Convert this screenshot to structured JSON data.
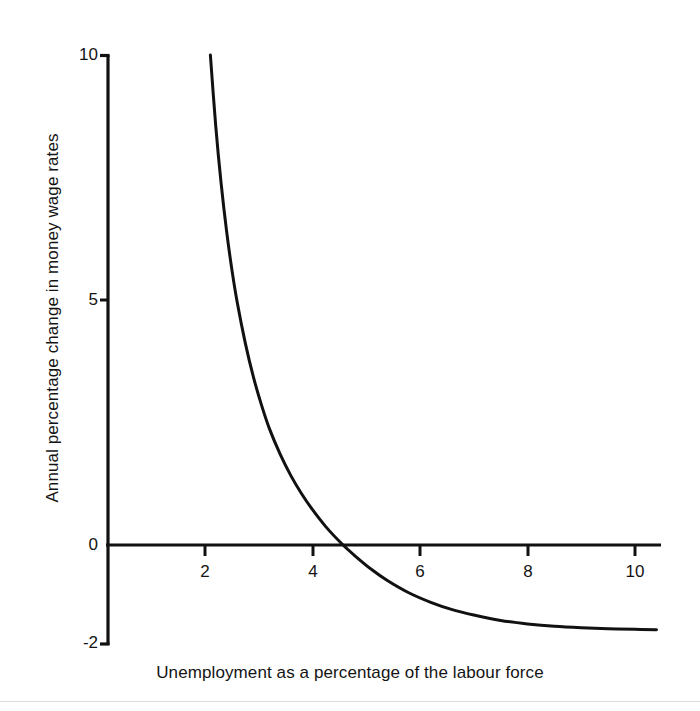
{
  "figure": {
    "background_color": "#ffffff",
    "ink_color": "#111111",
    "width": 700,
    "height": 711
  },
  "chart_data": {
    "type": "line",
    "title": "",
    "subtitle": "",
    "xlabel": "Unemployment as a percentage of the labour force",
    "ylabel": "Annual percentage change in money wage rates",
    "xlim": [
      0,
      10.5
    ],
    "ylim": [
      -2,
      10
    ],
    "xticks": [
      2,
      4,
      6,
      8,
      10
    ],
    "xtick_labels": [
      "2",
      "4",
      "6",
      "8",
      "10"
    ],
    "yticks": [
      -2,
      0,
      5,
      10
    ],
    "ytick_labels": [
      "-2",
      "0",
      "5",
      "10"
    ],
    "grid": false,
    "legend": null,
    "legend_position": "none",
    "annotations": [],
    "series": [
      {
        "name": "Phillips curve",
        "color": "#111111",
        "line_width": 3,
        "x": [
          2.1,
          2.2,
          2.3,
          2.4,
          2.5,
          2.6,
          2.75,
          2.9,
          3.05,
          3.2,
          3.4,
          3.6,
          3.8,
          4.0,
          4.25,
          4.55,
          4.8,
          5.1,
          5.4,
          5.8,
          6.2,
          6.6,
          7.0,
          7.5,
          8.0,
          8.5,
          9.0,
          9.5,
          10.0,
          10.4
        ],
        "y": [
          10.0,
          8.55,
          7.38,
          6.42,
          5.62,
          4.95,
          4.12,
          3.43,
          2.86,
          2.37,
          1.85,
          1.41,
          1.04,
          0.72,
          0.37,
          0.02,
          -0.23,
          -0.5,
          -0.73,
          -0.98,
          -1.17,
          -1.32,
          -1.43,
          -1.54,
          -1.61,
          -1.66,
          -1.69,
          -1.71,
          -1.72,
          -1.73
        ],
        "zero_crossing_x": 4.56,
        "asymptote_y": -1.75
      }
    ]
  },
  "axes": {
    "x_axis_label": "Unemployment as a percentage of the labour force",
    "y_axis_label": "Annual percentage change in money wage rates",
    "x_tick_values": [
      "2",
      "4",
      "6",
      "8",
      "10"
    ],
    "y_tick_values": [
      "10",
      "5",
      "0",
      "-2"
    ]
  }
}
